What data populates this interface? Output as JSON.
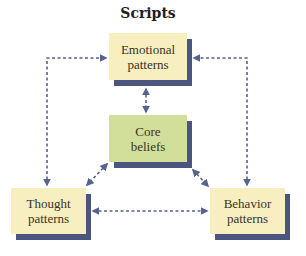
{
  "title": "Scripts",
  "nodes": {
    "emotional": {
      "line1": "Emotional",
      "line2": "patterns",
      "fill": "#f7efbf"
    },
    "core": {
      "line1": "Core",
      "line2": "beliefs",
      "fill": "#d2df9b"
    },
    "thought": {
      "line1": "Thought",
      "line2": "patterns",
      "fill": "#f7efbf"
    },
    "behavior": {
      "line1": "Behavior",
      "line2": "patterns",
      "fill": "#f7efbf"
    }
  },
  "connections": [
    {
      "from": "thought",
      "to": "emotional",
      "style": "dashed",
      "direction": "both"
    },
    {
      "from": "behavior",
      "to": "emotional",
      "style": "dashed",
      "direction": "both"
    },
    {
      "from": "emotional",
      "to": "core",
      "style": "dashed",
      "direction": "both"
    },
    {
      "from": "core",
      "to": "thought",
      "style": "dashed",
      "direction": "both"
    },
    {
      "from": "core",
      "to": "behavior",
      "style": "dashed",
      "direction": "both"
    },
    {
      "from": "thought",
      "to": "behavior",
      "style": "dashed",
      "direction": "both"
    }
  ],
  "colors": {
    "shadow": "#4a5580",
    "arrow": "#56628f"
  }
}
